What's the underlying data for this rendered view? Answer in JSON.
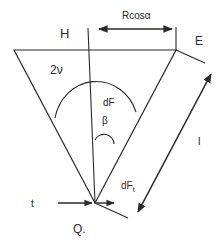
{
  "diagram": {
    "labels": {
      "H": "H",
      "rcos": "Rcosα",
      "E": "E",
      "two_nu": "2ν",
      "dF": "dF",
      "beta": "β",
      "l": "l",
      "dFt_main": "dF",
      "dFt_sub": "t",
      "t": "t",
      "Q": "Q."
    },
    "colors": {
      "line": "#2a2a2a",
      "background": "#ffffff"
    }
  }
}
